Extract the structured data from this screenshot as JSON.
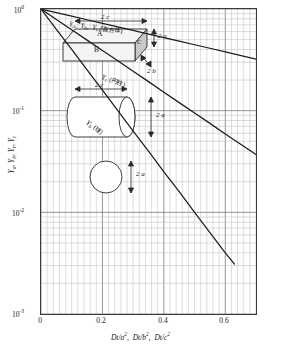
{
  "chart_data": {
    "type": "line",
    "title": "",
    "xlabel": "Dt/a2,  Dt/b2,  Dt/c2",
    "ylabel": "Ya, Yb, Yr, Yc",
    "xlim": [
      0,
      0.7
    ],
    "ylim": [
      0.001,
      1
    ],
    "yscale": "log",
    "xscale": "linear",
    "grid": "major-and-minor",
    "legend": "inline-curve-labels",
    "xticks": [
      "0",
      "0.2",
      "0.4",
      "0.6"
    ],
    "xtick_values": [
      0,
      0.2,
      0.4,
      0.6
    ],
    "yticks": [
      "10⁰",
      "10⁻¹",
      "10⁻²",
      "10⁻³"
    ],
    "ytick_values": [
      1,
      0.1,
      0.01,
      0.001
    ],
    "series": [
      {
        "name": "Ya, Yb, Yc (直方体)",
        "shape": "rectangular-prism",
        "x": [
          0,
          0.05,
          0.1,
          0.15,
          0.2,
          0.25,
          0.3,
          0.35,
          0.4,
          0.45,
          0.5,
          0.55,
          0.6,
          0.7
        ],
        "y": [
          1.0,
          0.92,
          0.85,
          0.784,
          0.723,
          0.667,
          0.615,
          0.567,
          0.523,
          0.483,
          0.445,
          0.411,
          0.379,
          0.322
        ]
      },
      {
        "name": "Yr (円柱)",
        "shape": "cylinder",
        "x": [
          0,
          0.05,
          0.1,
          0.15,
          0.2,
          0.25,
          0.3,
          0.35,
          0.4,
          0.45,
          0.5,
          0.55,
          0.6,
          0.7
        ],
        "y": [
          1.0,
          0.79,
          0.625,
          0.494,
          0.39,
          0.309,
          0.244,
          0.193,
          0.152,
          0.12,
          0.095,
          0.075,
          0.059,
          0.037
        ]
      },
      {
        "name": "Yb (球)",
        "shape": "sphere",
        "x": [
          0,
          0.05,
          0.1,
          0.15,
          0.2,
          0.25,
          0.3,
          0.35,
          0.4,
          0.45,
          0.5,
          0.55,
          0.6,
          0.63
        ],
        "y": [
          1.0,
          0.63,
          0.4,
          0.252,
          0.159,
          0.1,
          0.063,
          0.04,
          0.025,
          0.016,
          0.01,
          0.0063,
          0.004,
          0.0031
        ]
      }
    ],
    "annotations": [
      {
        "text": "Ya,  Yb,  Yc (直方体)",
        "series": 0
      },
      {
        "text": "Yr (円柱)",
        "series": 1
      },
      {
        "text": "Yb (球)",
        "series": 2
      }
    ]
  },
  "axes": {
    "y_label_parts": [
      {
        "sym": "Y",
        "sub": "a"
      },
      {
        "sym": "Y",
        "sub": "b"
      },
      {
        "sym": "Y",
        "sub": "r"
      },
      {
        "sym": "Y",
        "sub": "c"
      }
    ],
    "y_ticks": [
      {
        "mantissa": "10",
        "exp": "0",
        "value": 1
      },
      {
        "mantissa": "10",
        "exp": "-1",
        "value": 0.1
      },
      {
        "mantissa": "10",
        "exp": "-2",
        "value": 0.01
      },
      {
        "mantissa": "10",
        "exp": "-3",
        "value": 0.001
      }
    ],
    "x_ticks": [
      {
        "label": "0",
        "value": 0
      },
      {
        "label": "0.2",
        "value": 0.2
      },
      {
        "label": "0.4",
        "value": 0.4
      },
      {
        "label": "0.6",
        "value": 0.6
      }
    ],
    "x_axis_title": [
      {
        "sym": "Dt/a",
        "exp": "2"
      },
      {
        "sym": "Dt/b",
        "exp": "2"
      },
      {
        "sym": "Dt/c",
        "exp": "2"
      }
    ]
  },
  "curve_labels": {
    "prism": {
      "y1": "Y",
      "s1": "a",
      "y2": "Y",
      "s2": "b",
      "y3": "Y",
      "s3": "c",
      "jp": "(直方体)"
    },
    "cylinder": {
      "y1": "Y",
      "s1": "r",
      "jp": "(円柱)"
    },
    "sphere": {
      "y1": "Y",
      "s1": "b",
      "jp": "(球)"
    }
  },
  "insets": {
    "prism": {
      "face_top": "A",
      "face_front": "B",
      "face_side": "C",
      "dim_width": "2 c",
      "dim_height": "2 a",
      "dim_depth": "2 b"
    },
    "cylinder": {
      "dim_length": "2 c",
      "dim_diameter": "2 a"
    },
    "sphere": {
      "dim_diameter": "2 a"
    }
  },
  "colors": {
    "curve": "#1c1c1c",
    "grid_major": "#7a7a7a",
    "grid_minor": "#b4b4b4",
    "frame": "#3a3a3a",
    "inset_fill": "#f2f2f2",
    "inset_shade": "#c9c9c9",
    "text": "#1a1a1a"
  }
}
